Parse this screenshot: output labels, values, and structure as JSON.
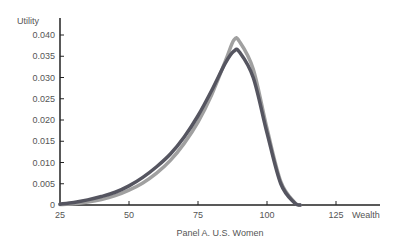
{
  "chart_data": {
    "type": "line",
    "title": "Panel A. U.S. Women",
    "xlabel": "Wealth",
    "ylabel": "Utility",
    "xlim": [
      25,
      140
    ],
    "ylim": [
      0,
      0.042
    ],
    "xticks": [
      25,
      50,
      75,
      100,
      125
    ],
    "yticks": [
      0,
      0.005,
      0.01,
      0.015,
      0.02,
      0.025,
      0.03,
      0.035,
      0.04
    ],
    "ytick_labels": [
      "0",
      "0.005",
      "0.010",
      "0.015",
      "0.020",
      "0.025",
      "0.030",
      "0.035",
      "0.040"
    ],
    "grid": false,
    "legend": null,
    "x": [
      25,
      30,
      35,
      40,
      45,
      50,
      55,
      60,
      65,
      70,
      75,
      80,
      85,
      88,
      90,
      95,
      100,
      105,
      110,
      112
    ],
    "series": [
      {
        "name": "dark curve",
        "color": "#555560",
        "values": [
          0.0002,
          0.0006,
          0.0012,
          0.002,
          0.003,
          0.0045,
          0.0065,
          0.009,
          0.012,
          0.016,
          0.021,
          0.027,
          0.0335,
          0.0362,
          0.036,
          0.03,
          0.017,
          0.005,
          0.0005,
          0
        ]
      },
      {
        "name": "light curve",
        "color": "#a0a0a0",
        "values": [
          0.0001,
          0.0003,
          0.0007,
          0.0013,
          0.0022,
          0.0035,
          0.0052,
          0.0075,
          0.0105,
          0.0145,
          0.0195,
          0.026,
          0.034,
          0.0388,
          0.0385,
          0.032,
          0.018,
          0.0055,
          0.0006,
          0
        ]
      }
    ]
  }
}
